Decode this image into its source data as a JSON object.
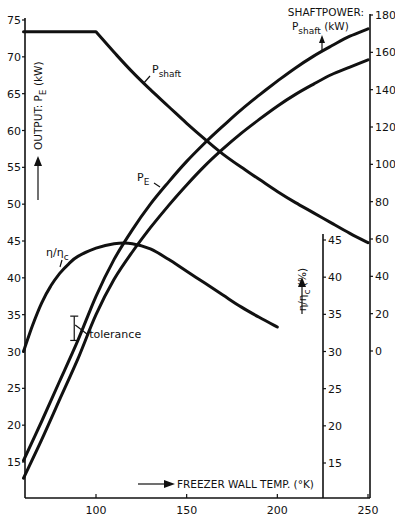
{
  "chart_data": {
    "type": "line",
    "title": "",
    "xlabel": "FREEZER WALL TEMP. (°K)",
    "x_axis": {
      "range": [
        60,
        250
      ],
      "ticks": [
        100,
        150,
        200,
        250
      ],
      "tick_labels": [
        "100",
        "150",
        "200",
        "250"
      ]
    },
    "y_axes": [
      {
        "id": "output",
        "label_parts": {
          "main": "OUTPUT: P",
          "sub": "E",
          "unit": " (kW)"
        },
        "position": "left",
        "range": [
          11,
          75
        ],
        "ticks": [
          15,
          20,
          25,
          30,
          35,
          40,
          45,
          50,
          55,
          60,
          65,
          70,
          75
        ],
        "tick_labels": [
          "15",
          "20",
          "25",
          "30",
          "35",
          "40",
          "45",
          "50",
          "55",
          "60",
          "65",
          "70",
          "75"
        ]
      },
      {
        "id": "eta",
        "label_parts": {
          "main": "η/η",
          "sub": "c",
          "unit": " (%)"
        },
        "position": "inner-right",
        "range": [
          11,
          46
        ],
        "ticks": [
          15,
          20,
          25,
          30,
          35,
          40,
          45
        ],
        "tick_labels": [
          "15",
          "20",
          "25",
          "30",
          "35",
          "40",
          "45"
        ]
      },
      {
        "id": "shaft",
        "label_line1": "SHAFTPOWER:",
        "label_parts": {
          "main": "P",
          "sub": "shaft",
          "unit": " (kW)"
        },
        "position": "right",
        "range": [
          0,
          180
        ],
        "ticks": [
          0,
          20,
          40,
          60,
          80,
          100,
          120,
          140,
          160,
          180
        ],
        "tick_labels": [
          "0",
          "20",
          "40",
          "60",
          "80",
          "100",
          "120",
          "140",
          "160",
          "180"
        ]
      }
    ],
    "series": [
      {
        "name": "P_E upper",
        "axis": "output",
        "x": [
          60,
          70,
          80,
          90,
          100,
          110,
          120,
          130,
          140,
          150,
          160,
          170,
          180,
          190,
          200,
          210,
          220,
          230,
          240,
          250
        ],
        "values": [
          15.2,
          20.5,
          26.0,
          31.5,
          37.5,
          42.5,
          46.5,
          50.0,
          53.0,
          55.8,
          58.3,
          60.6,
          62.8,
          64.8,
          66.7,
          68.5,
          70.1,
          71.5,
          72.8,
          73.8
        ]
      },
      {
        "name": "P_E lower",
        "axis": "output",
        "x": [
          60,
          70,
          80,
          90,
          100,
          110,
          120,
          130,
          140,
          150,
          160,
          170,
          180,
          190,
          200,
          210,
          220,
          230,
          240,
          250
        ],
        "values": [
          12.8,
          18.0,
          23.5,
          29.0,
          35.0,
          39.8,
          43.5,
          46.8,
          49.8,
          52.6,
          55.2,
          57.5,
          59.6,
          61.5,
          63.3,
          64.9,
          66.3,
          67.6,
          68.6,
          69.6
        ]
      },
      {
        "name": "P_shaft",
        "axis": "shaft",
        "x": [
          60,
          70,
          80,
          90,
          100,
          110,
          120,
          130,
          140,
          150,
          160,
          170,
          180,
          190,
          200,
          210,
          220,
          230,
          240,
          250
        ],
        "values": [
          171,
          171,
          171,
          171,
          171,
          160,
          149.5,
          140,
          131,
          122,
          113.5,
          105.5,
          98.5,
          92,
          85.5,
          79.5,
          74,
          68.5,
          63,
          58
        ]
      },
      {
        "name": "η/ηc",
        "axis": "eta",
        "x": [
          60,
          65,
          70,
          75,
          80,
          85,
          90,
          100,
          110,
          120,
          130,
          140,
          150,
          160,
          170,
          180,
          190,
          200
        ],
        "values": [
          30.0,
          33.5,
          36.5,
          38.8,
          40.5,
          41.8,
          42.8,
          43.9,
          44.5,
          44.5,
          43.8,
          42.4,
          40.8,
          39.2,
          37.6,
          36.0,
          34.6,
          33.3
        ]
      }
    ],
    "annotations": [
      {
        "text_parts": {
          "main": "P",
          "sub": "shaft"
        },
        "target": "P_shaft",
        "at_x": 120
      },
      {
        "text_parts": {
          "main": "P",
          "sub": "E"
        },
        "target": "P_E upper",
        "at_x": 131
      },
      {
        "text_parts": {
          "main": "η/η",
          "sub": "c"
        },
        "target": "η/ηc",
        "at_x": 75
      },
      {
        "text": "tolerance",
        "target": "P_E",
        "at_x": 88,
        "errorbar": {
          "x": 88,
          "low": 31.5,
          "high": 34.8
        }
      }
    ],
    "grid": false,
    "legend": "none"
  }
}
